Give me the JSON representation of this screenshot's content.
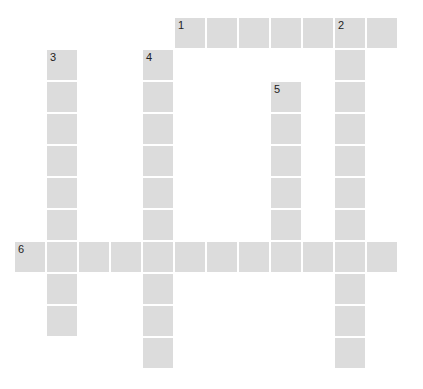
{
  "puzzle": {
    "cell_size": 30,
    "pitch": 32,
    "origin_x": 15,
    "origin_y": 18,
    "cell_color": "#dcdcdc",
    "number_color": "#222222",
    "words": [
      {
        "number": "1",
        "direction": "across",
        "row": 0,
        "col": 5,
        "length": 7
      },
      {
        "number": "2",
        "direction": "down",
        "row": 0,
        "col": 10,
        "length": 11
      },
      {
        "number": "3",
        "direction": "down",
        "row": 1,
        "col": 1,
        "length": 9
      },
      {
        "number": "4",
        "direction": "down",
        "row": 1,
        "col": 4,
        "length": 10
      },
      {
        "number": "5",
        "direction": "down",
        "row": 2,
        "col": 8,
        "length": 6
      },
      {
        "number": "6",
        "direction": "across",
        "row": 7,
        "col": 0,
        "length": 12
      }
    ]
  }
}
